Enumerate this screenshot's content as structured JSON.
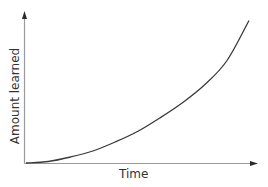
{
  "chart_data": {
    "type": "line",
    "title": "",
    "xlabel": "Time",
    "ylabel": "Amount learned",
    "x_ticks": [],
    "y_ticks": [],
    "grid": false,
    "legend": null,
    "axis_arrows": true,
    "xlim": [
      0,
      1
    ],
    "ylim": [
      0,
      1
    ],
    "series": [
      {
        "name": "Learning curve",
        "shape": "accelerating (convex, exponential-like)",
        "x": [
          0.0,
          0.1,
          0.2,
          0.3,
          0.4,
          0.5,
          0.6,
          0.7,
          0.8,
          0.9,
          1.0
        ],
        "y": [
          0.0,
          0.01,
          0.04,
          0.08,
          0.14,
          0.21,
          0.3,
          0.4,
          0.52,
          0.68,
          0.95
        ]
      }
    ]
  },
  "labels": {
    "x_axis": "Time",
    "y_axis": "Amount learned"
  },
  "colors": {
    "axis": "#9a9a9a",
    "arrow": "#2a2a2a",
    "curve": "#3a3a3a",
    "text": "#333333",
    "background": "#ffffff"
  }
}
